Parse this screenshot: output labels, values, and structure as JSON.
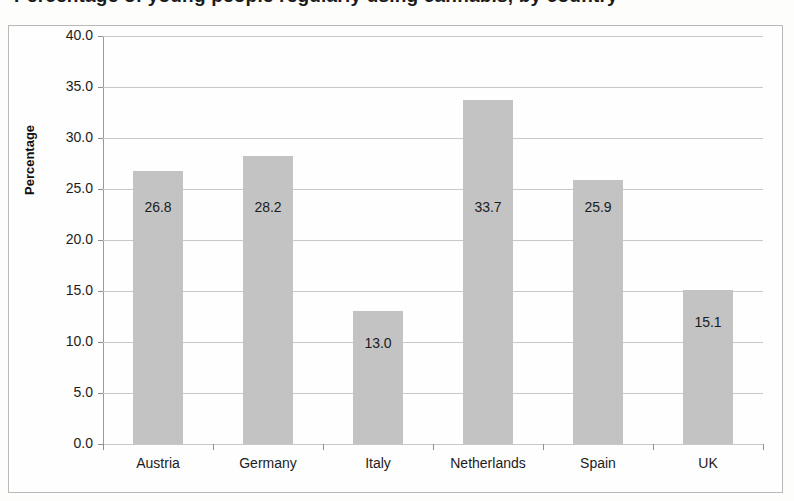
{
  "title": {
    "text": "Percentage of young people regularly using cannabis, by country",
    "visible_note": "clipped-at-top-of-scan"
  },
  "chart_data": {
    "type": "bar",
    "title": "Percentage of young people regularly using cannabis, by country",
    "xlabel": "",
    "ylabel": "Percentage",
    "categories": [
      "Austria",
      "Germany",
      "Italy",
      "Netherlands",
      "Spain",
      "UK"
    ],
    "values": [
      26.8,
      28.2,
      13.0,
      33.7,
      25.9,
      15.1
    ],
    "value_labels": [
      "26.8",
      "28.2",
      "13.0",
      "33.7",
      "25.9",
      "15.1"
    ],
    "ylim": [
      0,
      40
    ],
    "ytick_step": 5,
    "ytick_labels": [
      "40.0",
      "35.0",
      "30.0",
      "25.0",
      "20.0",
      "15.0",
      "10.0",
      "5.0",
      "0.0"
    ],
    "ytick_values": [
      40,
      35,
      30,
      25,
      20,
      15,
      10,
      5,
      0
    ],
    "grid": true,
    "legend": false,
    "bar_color": "#c3c3c3",
    "gridline_color": "#c8c8c8",
    "axis_color": "#8f8f8f",
    "text_color": "#1c1c1c",
    "label_placement": "inside-bar"
  }
}
